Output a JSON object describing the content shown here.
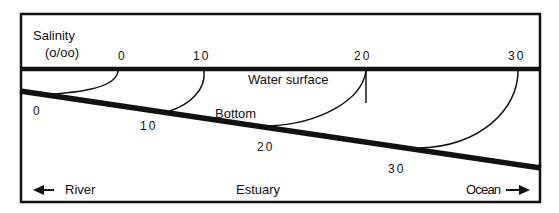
{
  "diagram": {
    "salinity_label": "Salinity",
    "salinity_unit": "(o/oo)",
    "surface_label": "Water surface",
    "bottom_label": "Bottom",
    "river_label": "River",
    "estuary_label": "Estuary",
    "ocean_label": "Ocean",
    "surface_values": [
      "0",
      "10",
      "20",
      "30"
    ],
    "bottom_values": [
      "0",
      "10",
      "20",
      "30"
    ],
    "colors": {
      "line": "#111111",
      "background": "#ffffff"
    }
  }
}
